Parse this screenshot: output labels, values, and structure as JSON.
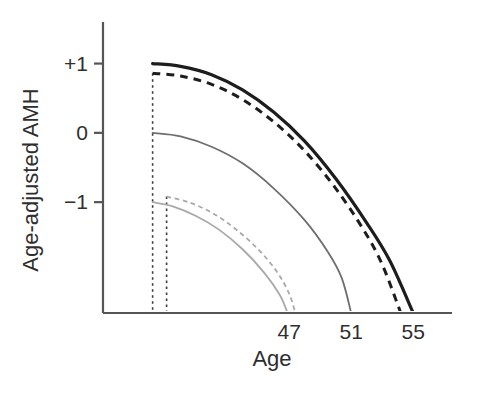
{
  "chart_data": {
    "type": "line",
    "title": "",
    "subtitle": "",
    "xlabel": "Age",
    "ylabel": "Age-adjusted AMH",
    "xlim": [
      35,
      57.5
    ],
    "ylim": [
      -2.6,
      1.6
    ],
    "grid": false,
    "legend_position": "none",
    "y_ticks": [
      {
        "value": 1,
        "label": "+1"
      },
      {
        "value": 0,
        "label": "0"
      },
      {
        "value": -1,
        "label": "−1"
      }
    ],
    "x_ticks": [
      {
        "value": 47,
        "label": "47"
      },
      {
        "value": 51,
        "label": "51"
      },
      {
        "value": 55,
        "label": "55"
      }
    ],
    "annotations": [
      {
        "name": "vertical-dotted-line-left",
        "x": 38.2,
        "y_top": 0.86,
        "y_bottom": -2.6
      },
      {
        "name": "vertical-dotted-line-right",
        "x": 39.1,
        "y_top": -0.92,
        "y_bottom": -2.6
      }
    ],
    "series": [
      {
        "name": "highest-amh-solid",
        "style": "solid",
        "color": "#1d1d1d",
        "width": 3.2,
        "start": {
          "x": 38.2,
          "y": 1.0
        },
        "end": {
          "x": 55.0,
          "y": -2.6
        },
        "points": [
          {
            "x": 38.2,
            "y": 1.0
          },
          {
            "x": 40.0,
            "y": 0.96
          },
          {
            "x": 42.0,
            "y": 0.84
          },
          {
            "x": 44.0,
            "y": 0.62
          },
          {
            "x": 46.0,
            "y": 0.3
          },
          {
            "x": 48.0,
            "y": -0.12
          },
          {
            "x": 50.0,
            "y": -0.66
          },
          {
            "x": 52.0,
            "y": -1.3
          },
          {
            "x": 53.5,
            "y": -1.85
          },
          {
            "x": 55.0,
            "y": -2.6
          }
        ]
      },
      {
        "name": "high-amh-dashed",
        "style": "dashed",
        "color": "#1d1d1d",
        "width": 3.0,
        "start": {
          "x": 38.2,
          "y": 0.86
        },
        "end": {
          "x": 54.2,
          "y": -2.6
        },
        "points": [
          {
            "x": 38.2,
            "y": 0.86
          },
          {
            "x": 40.0,
            "y": 0.82
          },
          {
            "x": 42.0,
            "y": 0.7
          },
          {
            "x": 44.0,
            "y": 0.48
          },
          {
            "x": 46.0,
            "y": 0.16
          },
          {
            "x": 48.0,
            "y": -0.26
          },
          {
            "x": 50.0,
            "y": -0.8
          },
          {
            "x": 51.8,
            "y": -1.4
          },
          {
            "x": 53.0,
            "y": -1.9
          },
          {
            "x": 54.2,
            "y": -2.6
          }
        ]
      },
      {
        "name": "mid-amh-solid",
        "style": "solid",
        "color": "#6e6e6e",
        "width": 1.8,
        "start": {
          "x": 38.2,
          "y": 0.0
        },
        "end": {
          "x": 51.0,
          "y": -2.6
        },
        "points": [
          {
            "x": 38.2,
            "y": 0.0
          },
          {
            "x": 40.0,
            "y": -0.05
          },
          {
            "x": 42.0,
            "y": -0.2
          },
          {
            "x": 44.0,
            "y": -0.44
          },
          {
            "x": 46.0,
            "y": -0.8
          },
          {
            "x": 48.0,
            "y": -1.26
          },
          {
            "x": 49.5,
            "y": -1.72
          },
          {
            "x": 50.4,
            "y": -2.1
          },
          {
            "x": 51.0,
            "y": -2.6
          }
        ]
      },
      {
        "name": "low-amh-dashed",
        "style": "dashed",
        "color": "#a9a9a9",
        "width": 1.8,
        "start": {
          "x": 39.1,
          "y": -0.92
        },
        "end": {
          "x": 47.4,
          "y": -2.6
        },
        "points": [
          {
            "x": 39.1,
            "y": -0.92
          },
          {
            "x": 40.5,
            "y": -1.0
          },
          {
            "x": 42.0,
            "y": -1.15
          },
          {
            "x": 43.5,
            "y": -1.38
          },
          {
            "x": 45.0,
            "y": -1.68
          },
          {
            "x": 46.2,
            "y": -2.0
          },
          {
            "x": 47.0,
            "y": -2.32
          },
          {
            "x": 47.4,
            "y": -2.6
          }
        ]
      },
      {
        "name": "lowest-amh-solid",
        "style": "solid",
        "color": "#a9a9a9",
        "width": 1.8,
        "start": {
          "x": 38.2,
          "y": -1.0
        },
        "end": {
          "x": 46.9,
          "y": -2.6
        },
        "points": [
          {
            "x": 38.2,
            "y": -1.0
          },
          {
            "x": 39.5,
            "y": -1.06
          },
          {
            "x": 41.0,
            "y": -1.2
          },
          {
            "x": 42.5,
            "y": -1.4
          },
          {
            "x": 44.0,
            "y": -1.68
          },
          {
            "x": 45.4,
            "y": -2.02
          },
          {
            "x": 46.4,
            "y": -2.34
          },
          {
            "x": 46.9,
            "y": -2.6
          }
        ]
      }
    ]
  },
  "axes": {
    "y_axis_color": "#555555",
    "x_axis_color": "#555555",
    "tick_color": "#555555"
  }
}
